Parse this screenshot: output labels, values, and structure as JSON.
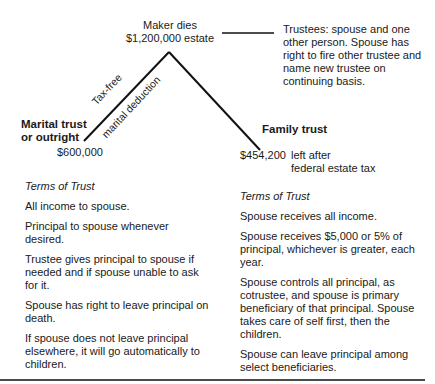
{
  "root": {
    "line1": "Maker dies",
    "line2": "$1,200,000 estate"
  },
  "trustees_note": "Trustees: spouse and one other person. Spouse has right to fire other trustee and name new trustee on continuing basis.",
  "branch_labels": {
    "upper": "Tax-free",
    "lower": "marital deduction"
  },
  "left": {
    "title_line1": "Marital trust",
    "title_line2": "or outright",
    "amount": "$600,000",
    "terms_heading": "Terms of Trust",
    "terms": [
      "All income to spouse.",
      "Principal to spouse whenever desired.",
      "Trustee gives principal to spouse if needed and if spouse unable to ask for it.",
      "Spouse has right to leave principal on death.",
      "If spouse does not leave principal elsewhere, it will go automatically to children."
    ]
  },
  "right": {
    "title": "Family trust",
    "amount": "$454,200",
    "amount_note_line1": "left after",
    "amount_note_line2": "federal estate tax",
    "terms_heading": "Terms of Trust",
    "terms": [
      "Spouse receives all income.",
      "Spouse receives $5,000 or 5% of principal, whichever is greater, each year.",
      "Spouse controls all principal, as cotrustee, and spouse is primary beneficiary of that principal. Spouse takes care of self first, then the children.",
      "Spouse can leave principal among select beneficiaries."
    ]
  }
}
